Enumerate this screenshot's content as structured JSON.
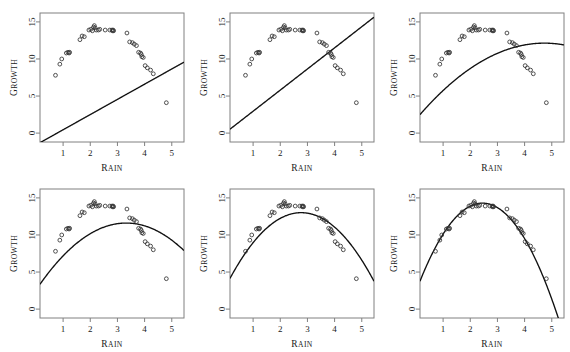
{
  "figure": {
    "name": "growth-vs-rain-model-fits",
    "panel_count": 6,
    "rows": 2,
    "cols": 3,
    "background": "#ffffff",
    "point_color": "#333333",
    "curve_color": "#111111",
    "frame_color": "#808080"
  },
  "axes": {
    "x_label_first": "R",
    "x_label_rest": "AIN",
    "y_label_first": "G",
    "y_label_rest": "ROWTH",
    "x_label_full": "RAIN",
    "y_label_full": "GROWTH",
    "x_ticks": [
      "1",
      "2",
      "3",
      "4",
      "5"
    ],
    "x_tick_values": [
      1,
      2,
      3,
      4,
      5
    ],
    "y_ticks": [
      "0",
      "5",
      "10",
      "15"
    ],
    "y_tick_values": [
      0,
      5,
      10,
      15
    ],
    "xlim": [
      0.15,
      5.45
    ],
    "ylim": [
      -1.2,
      16.2
    ]
  },
  "chart_data": {
    "type": "scatter",
    "title": "",
    "xlabel": "Rain",
    "ylabel": "Growth",
    "xlim": [
      0.15,
      5.45
    ],
    "ylim": [
      -1.2,
      16.2
    ],
    "grid": false,
    "legend": "none",
    "x": [
      0.72,
      0.88,
      0.95,
      1.12,
      1.18,
      1.22,
      1.24,
      1.62,
      1.7,
      1.78,
      1.95,
      2.02,
      2.08,
      2.12,
      2.15,
      2.18,
      2.22,
      2.3,
      2.35,
      2.55,
      2.72,
      2.8,
      2.82,
      2.84,
      2.86,
      3.35,
      3.45,
      3.55,
      3.62,
      3.7,
      3.78,
      3.85,
      3.88,
      3.9,
      3.95,
      4.02,
      4.1,
      4.22,
      4.32,
      4.8
    ],
    "y": [
      7.8,
      9.3,
      10.0,
      10.8,
      10.9,
      10.8,
      10.9,
      12.6,
      13.1,
      13.0,
      13.9,
      14.0,
      13.8,
      14.3,
      14.5,
      14.2,
      13.9,
      13.9,
      14.0,
      13.9,
      13.9,
      13.9,
      13.8,
      13.9,
      13.8,
      13.5,
      12.3,
      12.2,
      12.0,
      11.8,
      10.9,
      10.8,
      10.6,
      10.3,
      10.2,
      9.1,
      8.8,
      8.5,
      8.0,
      4.1
    ],
    "panels": [
      {
        "index": 1,
        "name": "panel-linear-steep",
        "fit_type": "linear",
        "fit_label": "straight line through origin region",
        "curve": {
          "kind": "polynomial",
          "coefficients": [
            -1.6,
            2.05,
            0.0
          ]
        },
        "description": "Upward straight line rising from about -1 at Rain 0.2 to 15 at Rain 5.45"
      },
      {
        "index": 2,
        "name": "panel-linear-shallow",
        "fit_type": "linear",
        "fit_label": "straight line with positive intercept",
        "curve": {
          "kind": "polynomial",
          "coefficients": [
            0.1,
            2.85,
            0.0
          ]
        },
        "description": "Upward straight line from about 0.8 at Rain 0.2 to 16 at Rain 5.45"
      },
      {
        "index": 3,
        "name": "panel-quadratic-flat",
        "fit_type": "quadratic",
        "fit_label": "shallow concave curve peaking late",
        "curve": {
          "kind": "polynomial",
          "coefficients": [
            1.85,
            4.35,
            -0.46
          ]
        },
        "description": "Gentle concave curve from 2.6 rising to about 11.9 near Rain 4.7"
      },
      {
        "index": 4,
        "name": "panel-quadratic-low",
        "fit_type": "quadratic",
        "fit_label": "concave curve peaking near Rain 3.3",
        "curve": {
          "kind": "polynomial",
          "coefficients": [
            2.55,
            5.45,
            -0.82
          ]
        },
        "description": "Concave curve from 3.5 peaking about 11.5 at Rain 3.3 then down to 8.3"
      },
      {
        "index": 5,
        "name": "panel-quadratic-mid",
        "fit_type": "quadratic",
        "fit_label": "concave curve peaking near Rain 2.8",
        "curve": {
          "kind": "polynomial",
          "coefficients": [
            3.1,
            7.15,
            -1.29
          ]
        },
        "description": "Concave curve from 5.0 peaking about 13.0 at Rain 2.75 then down to 2.8"
      },
      {
        "index": 6,
        "name": "panel-quadratic-best",
        "fit_type": "quadratic",
        "fit_label": "best-fitting concave curve peaking near Rain 2.4",
        "curve": {
          "kind": "polynomial",
          "coefficients": [
            2.35,
            9.75,
            -1.99
          ]
        },
        "description": "Concave curve from 5.0 peaking about 14.3 at Rain 2.45 then down to -0.3"
      }
    ]
  }
}
